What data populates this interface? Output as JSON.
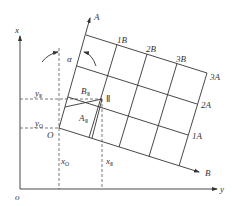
{
  "diagram": {
    "axes": {
      "x_label": "x",
      "y_label": "y",
      "origin_label": "o"
    },
    "rotated_axes": {
      "A_label": "A",
      "B_label": "B",
      "origin_label": "O",
      "angle_label": "α"
    },
    "grid_labels": {
      "b_ticks": [
        "1B",
        "2B",
        "3B"
      ],
      "a_ticks": [
        "1A",
        "2A",
        "3A"
      ]
    },
    "point": {
      "label": "Ⅱ"
    },
    "coords": {
      "yII_main": "y",
      "yII_sub": "Ⅱ",
      "yO_main": "y",
      "yO_sub": "O",
      "xO_main": "x",
      "xO_sub": "O",
      "xII_main": "x",
      "xII_sub": "Ⅱ"
    },
    "regions": {
      "BII_main": "B",
      "BII_sub": "Ⅱ",
      "AII_main": "A",
      "AII_sub": "Ⅱ"
    },
    "colors": {
      "line": "#333333",
      "dashed": "#555555",
      "background": "#ffffff"
    }
  }
}
